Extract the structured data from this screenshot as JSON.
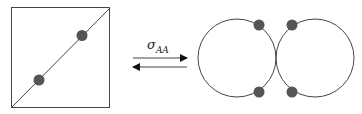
{
  "diagram": {
    "left_panel": {
      "shape": "square-with-diagonal",
      "dots": 2
    },
    "transition": {
      "symbol": "σ",
      "subscript": "AA",
      "forward_arrow": "right",
      "reverse_arrow": "left"
    },
    "right_panel": {
      "shape": "two-touching-circles",
      "dots": 4
    },
    "colors": {
      "line": "#333333",
      "dot": "#555555",
      "background": "#ffffff"
    }
  }
}
